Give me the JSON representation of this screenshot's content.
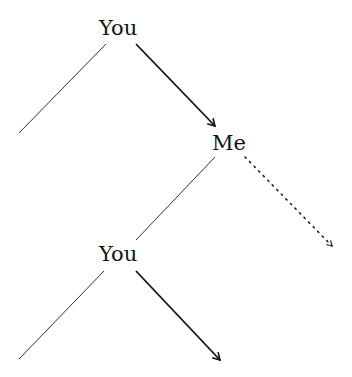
{
  "diagram": {
    "type": "game-tree",
    "nodes": [
      {
        "id": "n1",
        "label": "You",
        "x": 99,
        "y": 18
      },
      {
        "id": "n2",
        "label": "Me",
        "x": 212,
        "y": 133
      },
      {
        "id": "n3",
        "label": "You",
        "x": 99,
        "y": 245
      }
    ],
    "edges": [
      {
        "from": "n1",
        "to": "left-leaf-1",
        "style": "thin",
        "x1": 106,
        "y1": 44,
        "x2": 19,
        "y2": 133
      },
      {
        "from": "n1",
        "to": "n2",
        "style": "arrow-bold",
        "x1": 136,
        "y1": 44,
        "x2": 216,
        "y2": 127
      },
      {
        "from": "n2",
        "to": "n3",
        "style": "thin",
        "x1": 215,
        "y1": 157,
        "x2": 136,
        "y2": 240
      },
      {
        "from": "n2",
        "to": "right-leaf-1",
        "style": "arrow-dotted",
        "x1": 245,
        "y1": 157,
        "x2": 333,
        "y2": 247
      },
      {
        "from": "n3",
        "to": "left-leaf-2",
        "style": "thin",
        "x1": 104,
        "y1": 271,
        "x2": 19,
        "y2": 359
      },
      {
        "from": "n3",
        "to": "right-leaf-2",
        "style": "arrow-bold",
        "x1": 136,
        "y1": 271,
        "x2": 221,
        "y2": 361
      }
    ],
    "colors": {
      "line": "#333333",
      "bold": "#111111",
      "text": "#111111"
    }
  }
}
